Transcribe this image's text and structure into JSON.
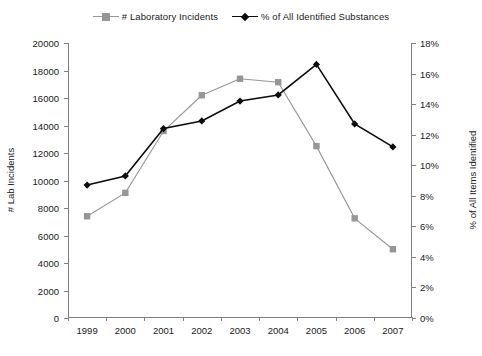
{
  "chart_data": {
    "type": "line",
    "title": "",
    "subtitle": "",
    "xlabel": "",
    "ylabel": "# Lab Incidents",
    "y2label": "% of All Items Identified",
    "categories": [
      "1999",
      "2000",
      "2001",
      "2002",
      "2003",
      "2004",
      "2005",
      "2006",
      "2007"
    ],
    "ylim": [
      0,
      20000
    ],
    "y2lim": [
      0,
      18
    ],
    "yticks": [
      0,
      2000,
      4000,
      6000,
      8000,
      10000,
      12000,
      14000,
      16000,
      18000,
      20000
    ],
    "ytick_labels": [
      "0",
      "2000",
      "4000",
      "6000",
      "8000",
      "10000",
      "12000",
      "14000",
      "16000",
      "18000",
      "20000"
    ],
    "y2ticks": [
      0,
      2,
      4,
      6,
      8,
      10,
      12,
      14,
      16,
      18
    ],
    "y2tick_labels": [
      "0%",
      "2%",
      "4%",
      "6%",
      "8%",
      "10%",
      "12%",
      "14%",
      "16%",
      "18%"
    ],
    "grid": false,
    "legend_position": "top-center",
    "series": [
      {
        "name": "# Laboratory Incidents",
        "axis": "left",
        "color": "#969696",
        "marker": "square",
        "values": [
          7400,
          9100,
          13600,
          16200,
          17400,
          17150,
          12500,
          7250,
          5000
        ]
      },
      {
        "name": "% of All Identified Substances",
        "axis": "right",
        "color": "#0d0d0d",
        "marker": "diamond",
        "values": [
          8.7,
          9.3,
          12.4,
          12.9,
          14.2,
          14.6,
          16.6,
          12.7,
          11.2
        ]
      }
    ]
  },
  "legend": {
    "items": [
      {
        "label": "# Laboratory Incidents",
        "marker": "square-marker-icon"
      },
      {
        "label": "% of All Identified Substances",
        "marker": "diamond-marker-icon"
      }
    ]
  },
  "colors": {
    "series_gray": "#969696",
    "series_black": "#0d0d0d",
    "axis": "#808080",
    "text": "#1a1a1a",
    "background": "#ffffff"
  }
}
